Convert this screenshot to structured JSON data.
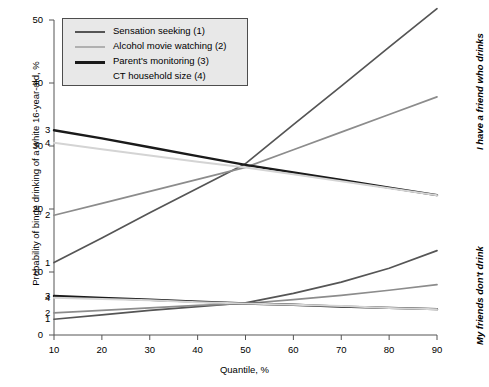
{
  "chart_data": {
    "type": "line",
    "title": "",
    "xlabel": "Quantile, %",
    "ylabel": "Probability of binge drinking of a white 16-year-old, %",
    "xlim": [
      10,
      90
    ],
    "ylim": [
      0,
      50
    ],
    "xticks": [
      10,
      20,
      30,
      40,
      50,
      60,
      70,
      80,
      90
    ],
    "yticks": [
      0,
      10,
      20,
      30,
      40,
      50
    ],
    "grid": false,
    "legend_position": "top-left",
    "x": [
      10,
      20,
      30,
      40,
      50,
      60,
      70,
      80,
      90
    ],
    "panels": [
      {
        "name": "I have a friend who drinks",
        "label": "I have a friend who drinks",
        "series": [
          {
            "name": "Sensation seeking (1)",
            "tag": "1",
            "color": "#555555",
            "values": [
              11.5,
              15.4,
              19.4,
              23.3,
              27.2,
              33.4,
              39.5,
              45.7,
              51.8
            ]
          },
          {
            "name": "Alcohol movie watching (2)",
            "tag": "2",
            "color": "#8c8c8c",
            "values": [
              19.0,
              20.9,
              22.8,
              24.7,
              26.6,
              29.4,
              32.2,
              35.0,
              37.8
            ]
          },
          {
            "name": "Parent's monitoring (3)",
            "tag": "3",
            "color": "#1a1a1a",
            "values": [
              32.5,
              31.2,
              29.8,
              28.4,
              27.0,
              25.8,
              24.6,
              23.4,
              22.2
            ]
          },
          {
            "name": "CT household size (4)",
            "tag": "4",
            "color": "#d4d4d4",
            "values": [
              30.5,
              29.5,
              28.5,
              27.5,
              26.6,
              25.5,
              24.4,
              23.3,
              22.2
            ]
          }
        ]
      },
      {
        "name": "My friends don't drink",
        "label": "My friends don't drink",
        "series": [
          {
            "name": "Sensation seeking (1)",
            "tag": "1",
            "color": "#555555",
            "values": [
              2.5,
              3.2,
              3.9,
              4.5,
              5.1,
              6.6,
              8.4,
              10.6,
              13.4
            ]
          },
          {
            "name": "Alcohol movie watching (2)",
            "tag": "2",
            "color": "#8c8c8c",
            "values": [
              3.5,
              3.9,
              4.3,
              4.7,
              5.0,
              5.6,
              6.3,
              7.1,
              8.0
            ]
          },
          {
            "name": "Parent's monitoring (3)",
            "tag": "3",
            "color": "#1a1a1a",
            "values": [
              6.2,
              5.9,
              5.6,
              5.3,
              5.0,
              4.8,
              4.5,
              4.3,
              4.1
            ]
          },
          {
            "name": "CT household size (4)",
            "tag": "4",
            "color": "#d4d4d4",
            "values": [
              5.9,
              5.7,
              5.5,
              5.2,
              5.0,
              4.8,
              4.6,
              4.3,
              4.1
            ]
          }
        ]
      }
    ]
  },
  "legend": {
    "items": [
      {
        "label": "Sensation seeking (1)",
        "color": "#555555"
      },
      {
        "label": "Alcohol movie watching (2)",
        "color": "#b0b0b0"
      },
      {
        "label": "Parent's monitoring (3)",
        "color": "#1a1a1a"
      },
      {
        "label": "CT household size (4)",
        "color": "#e8e8e8"
      }
    ]
  },
  "axes": {
    "y_title": "Probability of binge drinking of a white 16-year-old, %",
    "x_title": "Quantile, %",
    "y_tick_labels": [
      "0",
      "10",
      "20",
      "30",
      "40",
      "50"
    ],
    "x_tick_labels": [
      "10",
      "20",
      "30",
      "40",
      "50",
      "60",
      "70",
      "80",
      "90"
    ]
  },
  "panel_labels": {
    "top": "I have a friend who drinks",
    "bottom": "My friends don't drink"
  }
}
